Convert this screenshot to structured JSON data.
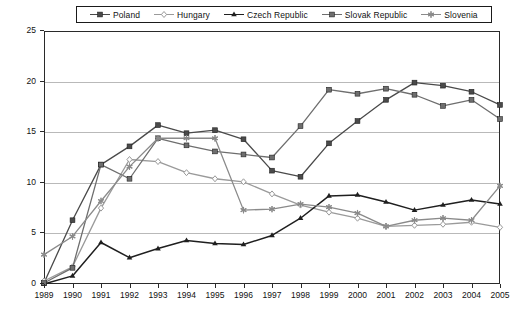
{
  "chart_data": {
    "type": "line",
    "title": "",
    "xlabel": "",
    "ylabel": "Percent of labor force",
    "x": [
      1989,
      1990,
      1991,
      1992,
      1993,
      1994,
      1995,
      1996,
      1997,
      1998,
      1999,
      2000,
      2001,
      2002,
      2003,
      2004,
      2005
    ],
    "xlim": [
      1989,
      2005
    ],
    "ylim": [
      0,
      25
    ],
    "yticks": [
      0,
      5,
      10,
      15,
      20,
      25
    ],
    "grid": true,
    "legend_position": "top",
    "series": [
      {
        "name": "Poland",
        "marker": "filled-square",
        "color": "#4a4a4a",
        "values": [
          0.1,
          6.3,
          11.8,
          13.6,
          15.7,
          14.9,
          15.2,
          14.3,
          11.2,
          10.6,
          13.9,
          16.1,
          18.2,
          19.9,
          19.6,
          19.0,
          17.7
        ]
      },
      {
        "name": "Hungary",
        "marker": "open-diamond",
        "color": "#9a9a9a",
        "values": [
          0.3,
          1.7,
          7.5,
          12.3,
          12.1,
          11.0,
          10.4,
          10.1,
          8.9,
          7.8,
          7.1,
          6.5,
          5.7,
          5.8,
          5.9,
          6.1,
          5.6
        ]
      },
      {
        "name": "Czech Republic",
        "marker": "filled-triangle",
        "color": "#1f1f1f",
        "values": [
          0.0,
          0.8,
          4.1,
          2.6,
          3.5,
          4.3,
          4.0,
          3.9,
          4.8,
          6.5,
          8.7,
          8.8,
          8.1,
          7.3,
          7.8,
          8.3,
          7.9
        ]
      },
      {
        "name": "Slovak Republic",
        "marker": "filled-square-grey",
        "color": "#6e6e6e",
        "values": [
          0.1,
          1.6,
          11.8,
          10.4,
          14.4,
          13.7,
          13.1,
          12.8,
          12.5,
          15.6,
          19.2,
          18.8,
          19.3,
          18.7,
          17.6,
          18.2,
          16.3
        ]
      },
      {
        "name": "Slovenia",
        "marker": "asterisk",
        "color": "#8a8a8a",
        "values": [
          2.9,
          4.7,
          8.2,
          11.6,
          14.4,
          14.4,
          14.4,
          7.3,
          7.4,
          7.9,
          7.6,
          7.0,
          5.7,
          6.3,
          6.5,
          6.3,
          9.7
        ]
      }
    ]
  },
  "legend": {
    "items": [
      {
        "label": "Poland"
      },
      {
        "label": "Hungary"
      },
      {
        "label": "Czech Republic"
      },
      {
        "label": "Slovak Republic"
      },
      {
        "label": "Slovenia"
      }
    ]
  },
  "axes": {
    "y_title": "Percent of labor force",
    "y_labels": [
      "25",
      "20",
      "15",
      "10",
      "5",
      "0"
    ],
    "x_labels": [
      "1989",
      "1990",
      "1991",
      "1992",
      "1993",
      "1994",
      "1995",
      "1996",
      "1997",
      "1998",
      "1999",
      "2000",
      "2001",
      "2002",
      "2003",
      "2004",
      "2005"
    ]
  }
}
